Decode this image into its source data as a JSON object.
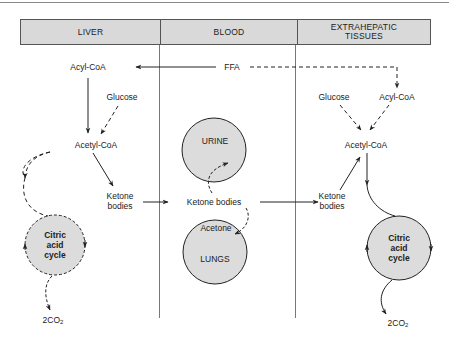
{
  "columns": [
    {
      "id": "liver",
      "label": "LIVER"
    },
    {
      "id": "blood",
      "label": "BLOOD"
    },
    {
      "id": "extrahepatic",
      "label": "EXTRAHEPATIC TISSUES"
    }
  ],
  "liver": {
    "acyl_coa": "Acyl-CoA",
    "glucose": "Glucose",
    "acetyl_coa": "Acetyl-CoA",
    "ketone_bodies": "Ketone bodies",
    "citric_cycle": "Citric acid cycle",
    "co2": "2CO",
    "co2_sub": "2"
  },
  "blood": {
    "ffa": "FFA",
    "urine": "URINE",
    "ketone_bodies": "Ketone bodies",
    "acetone": "Acetone",
    "lungs": "LUNGS"
  },
  "extrahepatic": {
    "glucose": "Glucose",
    "acyl_coa": "Acyl-CoA",
    "acetyl_coa": "Acetyl-CoA",
    "ketone_bodies": "Ketone bodies",
    "citric_cycle": "Citric acid cycle",
    "co2": "2CO",
    "co2_sub": "2"
  },
  "colors": {
    "header_fill": "#d9d9d9",
    "circle_fill": "#dcdcdc",
    "line": "#222222"
  }
}
